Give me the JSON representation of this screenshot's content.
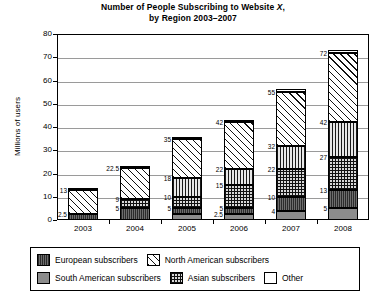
{
  "chart_data": {
    "type": "bar",
    "subtype": "stacked-bar",
    "title": "Number of People Subscribing to Website X, by Region 2003–2007",
    "title_line1": "Number of People Subscribing to Website X,",
    "title_line2": "by Region 2003–2007",
    "title_italic_token": "X",
    "xlabel": "",
    "ylabel": "Millions of users",
    "ylim": [
      0,
      80
    ],
    "ytick_step": 10,
    "yticks": [
      "0",
      "10",
      "20",
      "30",
      "40",
      "50",
      "60",
      "70",
      "80"
    ],
    "grid": true,
    "legend_position": "bottom",
    "categories": [
      "2003",
      "2004",
      "2005",
      "2006",
      "2007",
      "2008"
    ],
    "series": [
      {
        "name": "South American subscribers",
        "pattern": "solid-gray",
        "color": "#8c8c8c",
        "values": [
          0,
          0,
          2.5,
          2.5,
          4,
          5
        ],
        "cumulative_labels": [
          "",
          "",
          "",
          "2.5",
          "4",
          "5"
        ]
      },
      {
        "name": "European subscribers",
        "pattern": "dark-vertical-lines",
        "color": "#6d6d6d",
        "values": [
          2.5,
          5,
          2.5,
          2.5,
          6,
          8
        ],
        "cumulative_labels": [
          "2.5",
          "5",
          "5",
          "5",
          "10",
          "13"
        ]
      },
      {
        "name": "Asian subscribers",
        "pattern": "grid-checker",
        "color": "#d8d8d8",
        "values": [
          0,
          4,
          5,
          10,
          12,
          14
        ],
        "cumulative_labels": [
          "",
          "9",
          "10",
          "15",
          "22",
          "27"
        ]
      },
      {
        "name": "vertical-lines-segment",
        "pattern": "vertical-lines",
        "color": "#e8e8e8",
        "values": [
          0,
          0,
          8,
          7,
          10,
          15
        ],
        "cumulative_labels": [
          "",
          "",
          "18",
          "22",
          "32",
          "42"
        ]
      },
      {
        "name": "North American subscribers",
        "pattern": "diagonal-hatch",
        "color": "#ffffff",
        "values": [
          10.5,
          13.5,
          17,
          20,
          23,
          30
        ],
        "cumulative_labels": [
          "13",
          "22.5",
          "35",
          "42",
          "55",
          "72"
        ]
      },
      {
        "name": "Other",
        "pattern": "white-empty",
        "color": "#ffffff",
        "values": [
          0.5,
          0.5,
          0.8,
          1.2,
          1.2,
          1.3
        ],
        "cumulative_labels": [
          "",
          "",
          "",
          "",
          "",
          ""
        ]
      }
    ],
    "bar_totals": [
      13.5,
      23,
      35.8,
      43.2,
      56.2,
      73.3
    ],
    "annotations": {
      "2003": [
        "13",
        "2.5"
      ],
      "2004": [
        "22.5",
        "9",
        "5"
      ],
      "2005": [
        "35",
        "18",
        "10",
        "5"
      ],
      "2006": [
        "42",
        "22",
        "15",
        "5",
        "2.5"
      ],
      "2007": [
        "55",
        "32",
        "22",
        "10",
        "4"
      ],
      "2008": [
        "72",
        "42",
        "27",
        "13",
        "5"
      ]
    }
  },
  "legend": {
    "items": [
      {
        "label": "European subscribers",
        "pattern": "dark-vertical-lines"
      },
      {
        "label": "North American subscribers",
        "pattern": "diagonal-hatch"
      },
      {
        "label": "South American subscribers",
        "pattern": "solid-gray"
      },
      {
        "label": "Asian subscribers",
        "pattern": "grid-checker"
      },
      {
        "label": "Other",
        "pattern": "white-empty"
      }
    ]
  }
}
